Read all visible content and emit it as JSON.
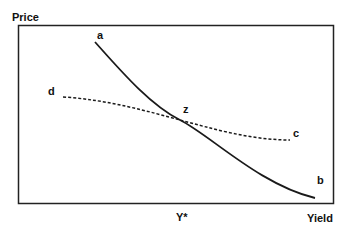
{
  "axes": {
    "y_label": "Price",
    "x_label": "Yield",
    "x_marker": "Y*"
  },
  "curves": [
    {
      "id": "ab",
      "style": "solid",
      "start_label": "a",
      "end_label": "b"
    },
    {
      "id": "dc",
      "style": "dotted",
      "start_label": "d",
      "end_label": "c"
    }
  ],
  "intersection_label": "z",
  "colors": {
    "line": "#1a1a1a",
    "background": "#ffffff"
  }
}
